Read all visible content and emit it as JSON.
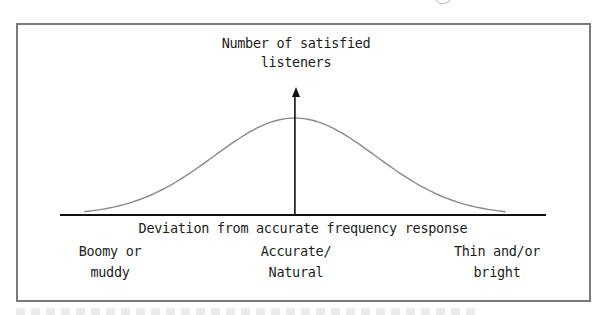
{
  "diagram": {
    "type": "bell-curve-concept",
    "y_axis": {
      "label_line1": "Number of satisfied",
      "label_line2": "listeners"
    },
    "x_axis": {
      "label": "Deviation from accurate frequency response"
    },
    "categories": [
      {
        "position": "left",
        "line1": "Boomy or",
        "line2": "muddy"
      },
      {
        "position": "center",
        "line1": "Accurate/",
        "line2": "Natural"
      },
      {
        "position": "right",
        "line1": "Thin and/or",
        "line2": "bright"
      }
    ],
    "curve": {
      "shape": "normal distribution",
      "peak_at": "center",
      "color": "#8a8a8a"
    },
    "colors": {
      "frame": "#7a7a7a",
      "axis": "#111111",
      "text": "#1c1c1c"
    }
  },
  "chart_data": {
    "type": "line",
    "title": "",
    "xlabel": "Deviation from accurate frequency response",
    "ylabel": "Number of satisfied listeners",
    "categories": [
      "Boomy or muddy",
      "Accurate/Natural",
      "Thin and/or bright"
    ],
    "series": [
      {
        "name": "satisfied listeners",
        "distribution": "gaussian",
        "mean": 0,
        "std": 1,
        "x": [
          -2.6,
          -2.0,
          -1.5,
          -1.0,
          -0.5,
          0,
          0.5,
          1.0,
          1.5,
          2.0,
          2.6
        ],
        "values": [
          0.03,
          0.14,
          0.32,
          0.61,
          0.88,
          1.0,
          0.88,
          0.61,
          0.32,
          0.14,
          0.03
        ]
      }
    ],
    "xlim": [
      -2.9,
      3.1
    ],
    "ylim": [
      0,
      1.35
    ],
    "grid": false,
    "legend": "none"
  }
}
